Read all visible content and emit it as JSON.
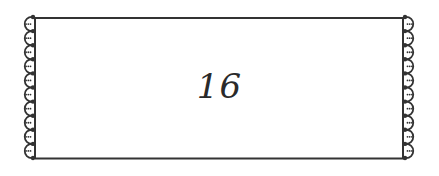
{
  "label": {
    "number": "16"
  },
  "frame": {
    "line_color": "#333333",
    "scallops_per_side": 10,
    "style": "scalloped-edge-label"
  }
}
